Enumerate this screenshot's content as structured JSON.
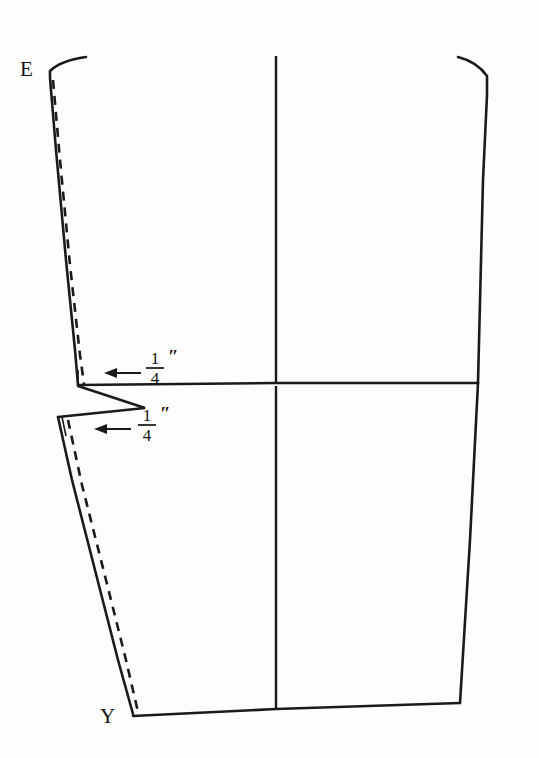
{
  "figure": {
    "type": "sewing-pattern-diagram",
    "background_color": "#fdfdfc",
    "line_color": "#1a1a1a",
    "width": 539,
    "height": 758
  },
  "labels": {
    "point_e": "E",
    "point_y": "Y"
  },
  "measurements": [
    {
      "id": "upper-seam-allowance",
      "numerator": "1",
      "denominator": "4",
      "unit_mark": "″",
      "arrow_direction": "left"
    },
    {
      "id": "lower-seam-allowance",
      "numerator": "1",
      "denominator": "4",
      "unit_mark": "″",
      "arrow_direction": "left"
    }
  ],
  "pieces": {
    "upper_bodice": {
      "name": "upper-pattern-piece",
      "has_dashed_seam_line": true
    },
    "lower_bodice": {
      "name": "lower-pattern-piece",
      "has_dashed_seam_line": true
    }
  },
  "guides": {
    "center_grain_line": "vertical-center-line",
    "waist_line": "horizontal-waist-line"
  }
}
